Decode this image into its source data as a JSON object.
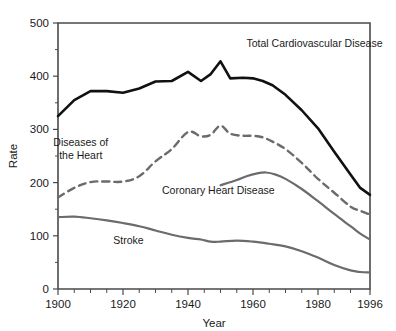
{
  "chart_data": {
    "type": "line",
    "title": "",
    "xlabel": "Year",
    "ylabel": "Rate",
    "xlim": [
      1900,
      1996
    ],
    "ylim": [
      0,
      500
    ],
    "grid": false,
    "legend_position": "inline-annotations",
    "y_ticks": [
      0,
      100,
      200,
      300,
      400,
      500
    ],
    "y_tick_labels": [
      "0",
      "100",
      "200",
      "300",
      "400",
      "500"
    ],
    "y_minor_ticks": [
      50,
      150,
      250,
      350,
      450
    ],
    "x_ticks": [
      1900,
      1920,
      1940,
      1960,
      1980,
      1996
    ],
    "x_tick_labels": [
      "1900",
      "1920",
      "1940",
      "1960",
      "1980",
      "1996"
    ],
    "x_minor_ticks": [
      1905,
      1910,
      1915,
      1925,
      1930,
      1935,
      1945,
      1950,
      1955,
      1965,
      1970,
      1975,
      1985,
      1990
    ],
    "series": [
      {
        "name": "Total Cardiovascular Disease",
        "color": "#111111",
        "style": "solid",
        "width": 2.6,
        "label_x": 1958,
        "label_y": 455,
        "label_anchor": "start",
        "x": [
          1900,
          1905,
          1910,
          1915,
          1920,
          1925,
          1930,
          1935,
          1940,
          1944,
          1947,
          1950,
          1953,
          1957,
          1960,
          1963,
          1966,
          1970,
          1975,
          1980,
          1985,
          1990,
          1993,
          1996
        ],
        "y": [
          325,
          355,
          372,
          372,
          369,
          377,
          390,
          391,
          408,
          391,
          404,
          428,
          396,
          397,
          396,
          391,
          383,
          365,
          336,
          302,
          258,
          215,
          190,
          177
        ]
      },
      {
        "name": "Diseases of the Heart",
        "color": "#6b6b6b",
        "style": "dashed",
        "width": 2.4,
        "label_x": 1907,
        "label_y": 268,
        "label_anchor": "start",
        "x": [
          1900,
          1905,
          1910,
          1915,
          1920,
          1925,
          1930,
          1935,
          1940,
          1944,
          1947,
          1950,
          1953,
          1957,
          1960,
          1963,
          1966,
          1970,
          1975,
          1980,
          1985,
          1990,
          1993,
          1996
        ],
        "y": [
          172,
          190,
          201,
          202,
          202,
          212,
          240,
          263,
          295,
          287,
          290,
          307,
          292,
          288,
          288,
          285,
          277,
          263,
          237,
          207,
          181,
          155,
          147,
          140
        ]
      },
      {
        "name": "Coronary Heart Disease",
        "color": "#6b6b6b",
        "style": "solid",
        "width": 2.2,
        "label_x": 1932,
        "label_y": 178,
        "label_anchor": "start",
        "x": [
          1950,
          1955,
          1958,
          1961,
          1964,
          1967,
          1970,
          1975,
          1980,
          1985,
          1990,
          1993,
          1996
        ],
        "y": [
          195,
          205,
          212,
          217,
          219,
          215,
          207,
          188,
          165,
          141,
          118,
          104,
          93
        ]
      },
      {
        "name": "Stroke",
        "color": "#6b6b6b",
        "style": "solid",
        "width": 2.2,
        "label_x": 1917,
        "label_y": 85,
        "label_anchor": "start",
        "x": [
          1900,
          1905,
          1910,
          1915,
          1920,
          1925,
          1930,
          1935,
          1940,
          1944,
          1947,
          1950,
          1955,
          1960,
          1965,
          1970,
          1975,
          1980,
          1985,
          1990,
          1993,
          1996
        ],
        "y": [
          135,
          136,
          133,
          129,
          124,
          118,
          110,
          102,
          96,
          93,
          89,
          89,
          91,
          89,
          85,
          80,
          71,
          59,
          45,
          35,
          32,
          31
        ]
      }
    ]
  },
  "layout": {
    "plot_left": 58,
    "plot_right": 370,
    "plot_top": 23,
    "plot_bottom": 289
  }
}
